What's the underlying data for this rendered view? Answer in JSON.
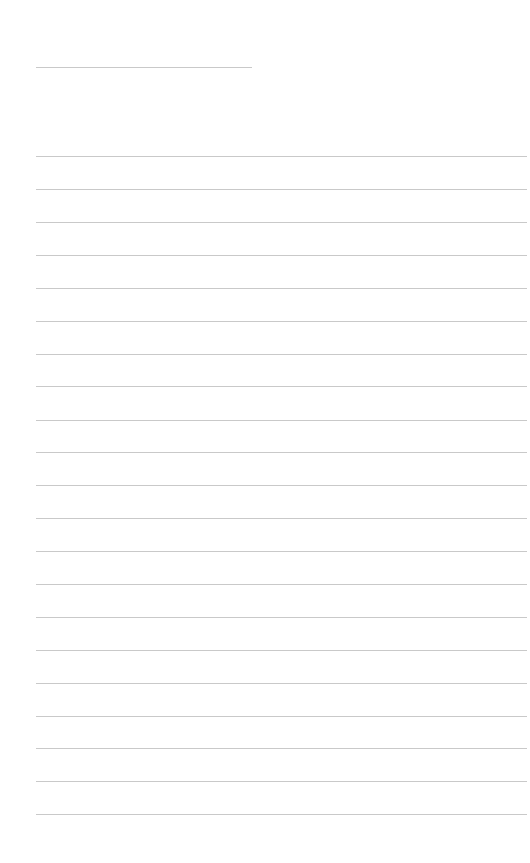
{
  "page": {
    "type": "lined-paper",
    "width": 530,
    "height": 863,
    "background": "#ffffff",
    "rule_color": "#c9c9c9"
  },
  "header_line": {
    "x_start": 36,
    "x_end": 252,
    "y": 67
  },
  "ruled_lines": {
    "x_start": 36,
    "x_end": 527,
    "count": 21,
    "y_positions": [
      156,
      189,
      222,
      255,
      288,
      321,
      354,
      386,
      420,
      452,
      485,
      518,
      551,
      584,
      617,
      650,
      683,
      716,
      748,
      781,
      814
    ]
  }
}
